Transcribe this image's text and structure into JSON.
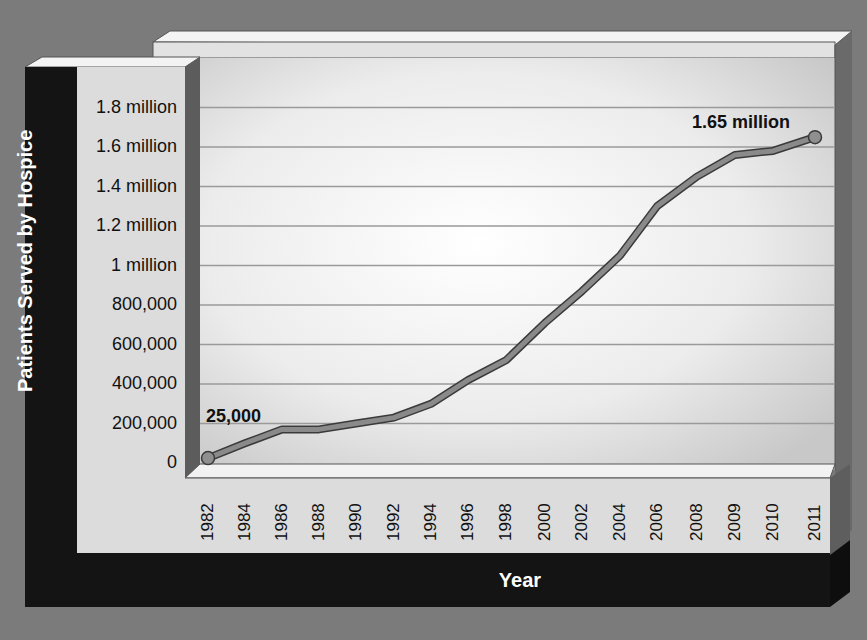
{
  "chart_data": {
    "type": "line",
    "title": "",
    "xlabel": "Year",
    "ylabel": "Patients Served by Hospice",
    "x": [
      "1982",
      "1984",
      "1986",
      "1988",
      "1990",
      "1992",
      "1994",
      "1996",
      "1998",
      "2000",
      "2002",
      "2004",
      "2006",
      "2008",
      "2009",
      "2010",
      "2011"
    ],
    "series": [
      {
        "name": "Patients Served by Hospice",
        "values": [
          25000,
          100000,
          170000,
          170000,
          200000,
          230000,
          300000,
          420000,
          520000,
          710000,
          870000,
          1050000,
          1300000,
          1450000,
          1560000,
          1580000,
          1650000
        ]
      }
    ],
    "y_ticks": [
      "0",
      "200,000",
      "400,000",
      "600,000",
      "800,000",
      "1 million",
      "1.2 million",
      "1.4 million",
      "1.6 million",
      "1.8 million"
    ],
    "ylim": [
      0,
      1800000
    ],
    "grid": true,
    "legend": "none",
    "annotations": [
      {
        "x": "1982",
        "label": "25,000"
      },
      {
        "x": "2011",
        "label": "1.65 million"
      }
    ]
  },
  "colors": {
    "background": "#7b7b7b",
    "panel_dark": "#141414",
    "panel_light": "#dcdcdc",
    "line": "#8a8a8a",
    "line_outline": "#3a3a3a",
    "gridline": "#9a9a9a"
  }
}
